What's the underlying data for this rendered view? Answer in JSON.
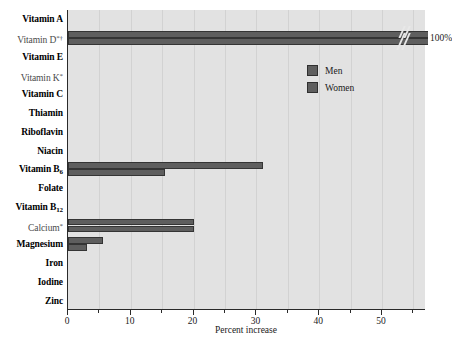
{
  "chart_data": {
    "type": "bar",
    "orientation": "horizontal",
    "title": "",
    "xlabel": "Percent increase",
    "ylabel": "",
    "xlim": [
      0,
      57
    ],
    "ylim": [
      0,
      16
    ],
    "grid": true,
    "legend_position": "upper-right",
    "xticks": [
      0,
      10,
      20,
      30,
      40,
      50
    ],
    "xticklabels": [
      "0",
      "10",
      "20",
      "30",
      "40",
      "50"
    ],
    "xminorticks": [
      5,
      15,
      25,
      35,
      45,
      55
    ],
    "categories": [
      "Vitamin A",
      "Vitamin D*†",
      "Vitamin E",
      "Vitamin K*",
      "Vitamin C",
      "Thiamin",
      "Riboflavin",
      "Niacin",
      "Vitamin B6",
      "Folate",
      "Vitamin B12",
      "Calcium*",
      "Magnesium",
      "Iron",
      "Iodine",
      "Zinc"
    ],
    "series": [
      {
        "name": "Men",
        "color": "#5e5e5e",
        "values": [
          0,
          100,
          0,
          0,
          0,
          0,
          0,
          0,
          31,
          0,
          0,
          20,
          5.5,
          0,
          0,
          0
        ]
      },
      {
        "name": "Women",
        "color": "#5e5e5e",
        "values": [
          0,
          100,
          0,
          0,
          0,
          0,
          0,
          0,
          15.5,
          0,
          0,
          20,
          3,
          0,
          0,
          0
        ]
      }
    ],
    "annotations": [
      {
        "text": "100%",
        "category": "Vitamin D*†",
        "note": "axis break: bars run off scale to 100 percent"
      }
    ]
  },
  "axis": {
    "xlabel": "Percent increase",
    "ticklabels": [
      "0",
      "10",
      "20",
      "30",
      "40",
      "50"
    ]
  },
  "legend": {
    "items": [
      {
        "label": "Men"
      },
      {
        "label": "Women"
      }
    ]
  },
  "ylabels": [
    {
      "text": "Vitamin A",
      "style": "bold",
      "html": "Vitamin A"
    },
    {
      "text": "Vitamin D*†",
      "style": "light",
      "html": "Vitamin D<sup>*†</sup>"
    },
    {
      "text": "Vitamin E",
      "style": "bold",
      "html": "Vitamin E"
    },
    {
      "text": "Vitamin K*",
      "style": "light",
      "html": "Vitamin K<sup>*</sup>"
    },
    {
      "text": "Vitamin C",
      "style": "bold",
      "html": "Vitamin C"
    },
    {
      "text": "Thiamin",
      "style": "bold",
      "html": "Thiamin"
    },
    {
      "text": "Riboflavin",
      "style": "bold",
      "html": "Riboflavin"
    },
    {
      "text": "Niacin",
      "style": "bold",
      "html": "Niacin"
    },
    {
      "text": "Vitamin B6",
      "style": "bold",
      "html": "Vitamin B<sub>6</sub>"
    },
    {
      "text": "Folate",
      "style": "bold",
      "html": "Folate"
    },
    {
      "text": "Vitamin B12",
      "style": "bold",
      "html": "Vitamin B<sub>12</sub>"
    },
    {
      "text": "Calcium*",
      "style": "light",
      "html": "Calcium<sup>*</sup>"
    },
    {
      "text": "Magnesium",
      "style": "bold",
      "html": "Magnesium"
    },
    {
      "text": "Iron",
      "style": "bold",
      "html": "Iron"
    },
    {
      "text": "Iodine",
      "style": "bold",
      "html": "Iodine"
    },
    {
      "text": "Zinc",
      "style": "bold",
      "html": "Zinc"
    }
  ],
  "annotation": {
    "offscale_label": "100%"
  },
  "colors": {
    "bar": "#5e5e5e",
    "bar_edge": "#343434",
    "plot_background": "#e2e2e2",
    "gridline": "#d2d2d2",
    "axis": "#2a2a2a",
    "text": "#1a1a1a"
  }
}
